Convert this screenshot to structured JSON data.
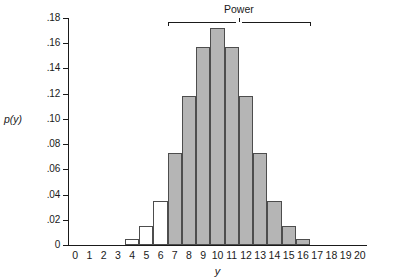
{
  "chart_data": {
    "type": "bar",
    "title": "",
    "xlabel": "y",
    "ylabel": "p(y)",
    "categories": [
      0,
      1,
      2,
      3,
      4,
      5,
      6,
      7,
      8,
      9,
      10,
      11,
      12,
      13,
      14,
      15,
      16,
      17,
      18,
      19,
      20
    ],
    "values": [
      0,
      0,
      0,
      0,
      0.005,
      0.015,
      0.035,
      0.073,
      0.118,
      0.157,
      0.172,
      0.157,
      0.118,
      0.073,
      0.035,
      0.015,
      0.005,
      0,
      0,
      0,
      0
    ],
    "bar_styles": [
      "open",
      "open",
      "open",
      "open",
      "open",
      "open",
      "open",
      "filled",
      "filled",
      "filled",
      "filled",
      "filled",
      "filled",
      "filled",
      "filled",
      "filled",
      "filled",
      "open",
      "open",
      "open",
      "open"
    ],
    "xlim": [
      -0.5,
      20.5
    ],
    "ylim": [
      0,
      0.18
    ],
    "ytick_values": [
      0,
      0.02,
      0.04,
      0.06,
      0.08,
      0.1,
      0.12,
      0.14,
      0.16,
      0.18
    ],
    "ytick_labels": [
      "0",
      ".02",
      ".04",
      ".06",
      ".08",
      ".10",
      ".12",
      ".14",
      ".16",
      ".18"
    ],
    "xtick_values": [
      0,
      1,
      2,
      3,
      4,
      5,
      6,
      7,
      8,
      9,
      10,
      11,
      12,
      13,
      14,
      15,
      16,
      17,
      18,
      19,
      20
    ],
    "xtick_labels": [
      "0",
      "1",
      "2",
      "3",
      "4",
      "5",
      "6",
      "7",
      "8",
      "9",
      "10",
      "11",
      "12",
      "13",
      "14",
      "15",
      "16",
      "17",
      "18",
      "19",
      "20"
    ],
    "grid": false,
    "legend": null,
    "annotations": [
      {
        "label": "Power",
        "type": "bracket",
        "x_start": 6.5,
        "x_end": 16.5,
        "y": 0.18
      }
    ],
    "colors": {
      "bar_fill": "#b5b5b5",
      "bar_edge": "#4d4d4d",
      "axis": "#1a1a1a",
      "background": "#ffffff"
    }
  }
}
